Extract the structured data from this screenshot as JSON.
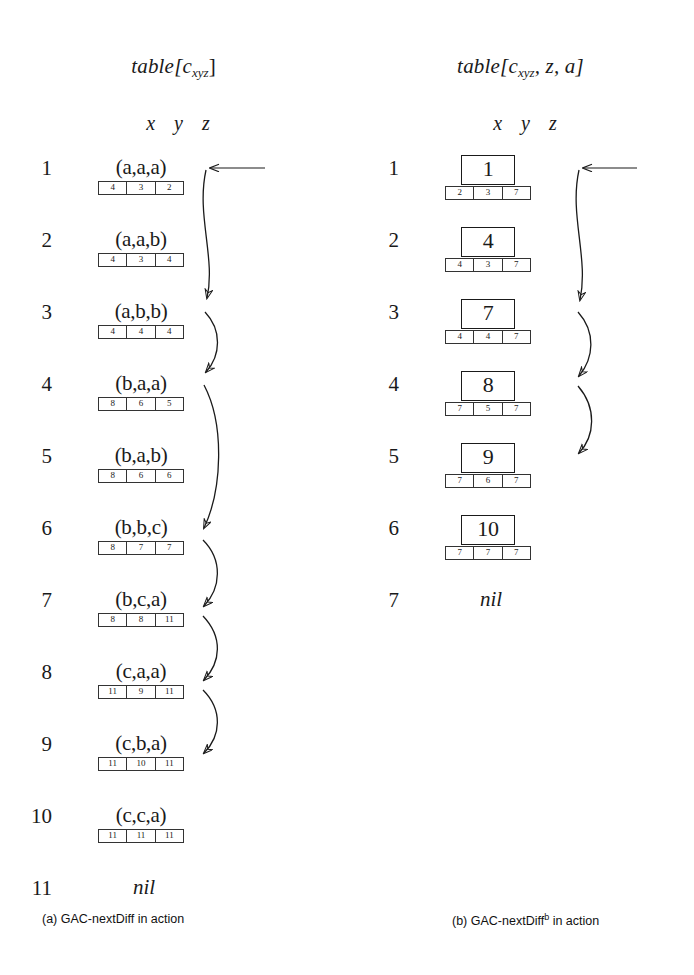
{
  "figure": {
    "panels": [
      {
        "id": "left",
        "title_prefix": "table[c",
        "title_sub": "xyz",
        "title_suffix": "]",
        "column_header": "x y z",
        "caption": "(a) GAC-nextDiff in action",
        "caption_label": "(a)",
        "caption_name": "GAC-nextDiff",
        "caption_sup": "",
        "caption_tail": "in action",
        "rows": [
          {
            "index": "1",
            "tuple": "(a,a,a)",
            "cells": [
              "4",
              "3",
              "2"
            ]
          },
          {
            "index": "2",
            "tuple": "(a,a,b)",
            "cells": [
              "4",
              "3",
              "4"
            ]
          },
          {
            "index": "3",
            "tuple": "(a,b,b)",
            "cells": [
              "4",
              "4",
              "4"
            ]
          },
          {
            "index": "4",
            "tuple": "(b,a,a)",
            "cells": [
              "8",
              "6",
              "5"
            ]
          },
          {
            "index": "5",
            "tuple": "(b,a,b)",
            "cells": [
              "8",
              "6",
              "6"
            ]
          },
          {
            "index": "6",
            "tuple": "(b,b,c)",
            "cells": [
              "8",
              "7",
              "7"
            ]
          },
          {
            "index": "7",
            "tuple": "(b,c,a)",
            "cells": [
              "8",
              "8",
              "11"
            ]
          },
          {
            "index": "8",
            "tuple": "(c,a,a)",
            "cells": [
              "11",
              "9",
              "11"
            ]
          },
          {
            "index": "9",
            "tuple": "(c,b,a)",
            "cells": [
              "11",
              "10",
              "11"
            ]
          },
          {
            "index": "10",
            "tuple": "(c,c,a)",
            "cells": [
              "11",
              "11",
              "11"
            ]
          },
          {
            "index": "11",
            "tuple": "nil",
            "cells": null
          }
        ],
        "arrows": [
          {
            "name": "arrow-row1-to-row3",
            "from_row": 1,
            "to_row": 3
          },
          {
            "name": "arrow-row3-to-row4",
            "from_row": 3,
            "to_row": 4
          },
          {
            "name": "arrow-row4-to-row6",
            "from_row": 4,
            "to_row": 6
          },
          {
            "name": "arrow-row6-to-row7",
            "from_row": 6,
            "to_row": 7
          },
          {
            "name": "arrow-row7-to-row8",
            "from_row": 7,
            "to_row": 8
          },
          {
            "name": "arrow-row8-to-row9",
            "from_row": 8,
            "to_row": 9
          }
        ],
        "entry_arrow": {
          "name": "entry-arrow",
          "target_row": 1
        }
      },
      {
        "id": "right",
        "title_prefix": "table[c",
        "title_sub": "xyz",
        "title_suffix": ", z, a]",
        "column_header": "x y z",
        "caption": "(b) GAC-nextDiff^b in action",
        "caption_label": "(b)",
        "caption_name": "GAC-nextDiff",
        "caption_sup": "b",
        "caption_tail": "in action",
        "rows": [
          {
            "index": "1",
            "value": "1",
            "cells": [
              "2",
              "3",
              "7"
            ]
          },
          {
            "index": "2",
            "value": "4",
            "cells": [
              "4",
              "3",
              "7"
            ]
          },
          {
            "index": "3",
            "value": "7",
            "cells": [
              "4",
              "4",
              "7"
            ]
          },
          {
            "index": "4",
            "value": "8",
            "cells": [
              "7",
              "5",
              "7"
            ]
          },
          {
            "index": "5",
            "value": "9",
            "cells": [
              "7",
              "6",
              "7"
            ]
          },
          {
            "index": "6",
            "value": "10",
            "cells": [
              "7",
              "7",
              "7"
            ]
          },
          {
            "index": "7",
            "value": "nil",
            "cells": null
          }
        ],
        "arrows": [
          {
            "name": "arrow-row1-to-row3",
            "from_row": 1,
            "to_row": 3
          },
          {
            "name": "arrow-row3-to-row4",
            "from_row": 3,
            "to_row": 4
          },
          {
            "name": "arrow-row4-to-row5",
            "from_row": 4,
            "to_row": 5
          }
        ],
        "entry_arrow": {
          "name": "entry-arrow",
          "target_row": 1
        }
      }
    ],
    "colors": {
      "ink": "#1a1a1a",
      "rule": "#333333",
      "background": "#ffffff"
    }
  }
}
